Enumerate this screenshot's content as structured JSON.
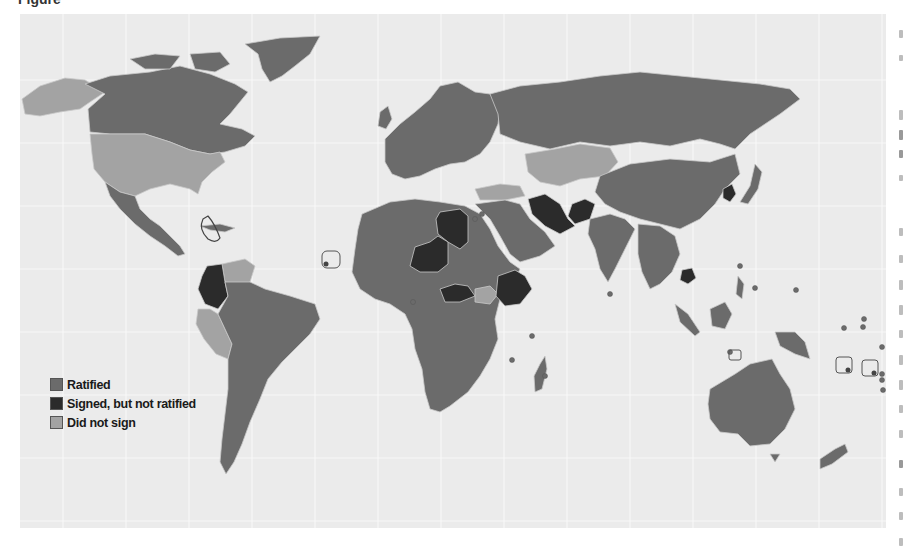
{
  "figure": {
    "title_fragment": "Figure"
  },
  "colors": {
    "background": "#ebebeb",
    "gridline": "#f7f7f7",
    "ratified": "#6b6b6b",
    "signed_not_ratified": "#2b2b2b",
    "did_not_sign": "#a3a3a3",
    "border": "#c9c9c9"
  },
  "legend": {
    "items": [
      {
        "label": "Ratified",
        "color": "#6b6b6b"
      },
      {
        "label": "Signed, but not ratified",
        "color": "#2b2b2b"
      },
      {
        "label": "Did not sign",
        "color": "#a3a3a3"
      }
    ]
  },
  "map": {
    "type": "choropleth world map",
    "categories": [
      "Ratified",
      "Signed, but not ratified",
      "Did not sign"
    ],
    "signed_not_ratified_regions": [
      "Colombia",
      "Libya",
      "Niger",
      "Central African Republic",
      "Ethiopia",
      "Iran",
      "Afghanistan",
      "North Korea",
      "Cambodia"
    ],
    "did_not_sign_regions": [
      "United States",
      "Alaska",
      "Peru",
      "Venezuela",
      "Kazakhstan",
      "Uzbekistan",
      "Turkmenistan",
      "Turkey",
      "South Sudan"
    ],
    "small_state_markers": 18
  }
}
